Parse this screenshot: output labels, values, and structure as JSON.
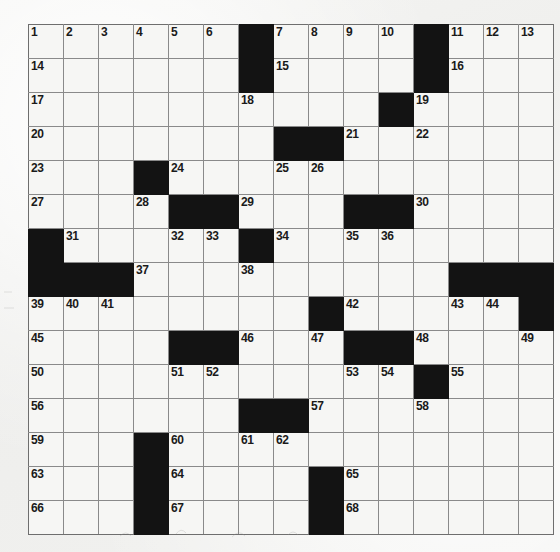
{
  "document": {
    "type": "crossword-puzzle",
    "title": "Crossword Puzzle Grid",
    "grid_size": "15x15",
    "background_color": "#f2f2f0",
    "block_color": "#131313",
    "cell_color": "#f6f6f4",
    "gridline_color": "#8a8a8a",
    "number_color": "#1a1a1a"
  },
  "grid": {
    "rows": 15,
    "cols": 15,
    "cells": [
      [
        {
          "block": false,
          "number": "1"
        },
        {
          "block": false,
          "number": "2"
        },
        {
          "block": false,
          "number": "3"
        },
        {
          "block": false,
          "number": "4"
        },
        {
          "block": false,
          "number": "5"
        },
        {
          "block": false,
          "number": "6"
        },
        {
          "block": true,
          "number": ""
        },
        {
          "block": false,
          "number": "7"
        },
        {
          "block": false,
          "number": "8"
        },
        {
          "block": false,
          "number": "9"
        },
        {
          "block": false,
          "number": "10"
        },
        {
          "block": true,
          "number": ""
        },
        {
          "block": false,
          "number": "11"
        },
        {
          "block": false,
          "number": "12"
        },
        {
          "block": false,
          "number": "13"
        }
      ],
      [
        {
          "block": false,
          "number": "14"
        },
        {
          "block": false,
          "number": ""
        },
        {
          "block": false,
          "number": ""
        },
        {
          "block": false,
          "number": ""
        },
        {
          "block": false,
          "number": ""
        },
        {
          "block": false,
          "number": ""
        },
        {
          "block": true,
          "number": ""
        },
        {
          "block": false,
          "number": "15"
        },
        {
          "block": false,
          "number": ""
        },
        {
          "block": false,
          "number": ""
        },
        {
          "block": false,
          "number": ""
        },
        {
          "block": true,
          "number": ""
        },
        {
          "block": false,
          "number": "16"
        },
        {
          "block": false,
          "number": ""
        },
        {
          "block": false,
          "number": ""
        }
      ],
      [
        {
          "block": false,
          "number": "17"
        },
        {
          "block": false,
          "number": ""
        },
        {
          "block": false,
          "number": ""
        },
        {
          "block": false,
          "number": ""
        },
        {
          "block": false,
          "number": ""
        },
        {
          "block": false,
          "number": ""
        },
        {
          "block": false,
          "number": "18"
        },
        {
          "block": false,
          "number": ""
        },
        {
          "block": false,
          "number": ""
        },
        {
          "block": false,
          "number": ""
        },
        {
          "block": true,
          "number": ""
        },
        {
          "block": false,
          "number": "19"
        },
        {
          "block": false,
          "number": ""
        },
        {
          "block": false,
          "number": ""
        },
        {
          "block": false,
          "number": ""
        }
      ],
      [
        {
          "block": false,
          "number": "20"
        },
        {
          "block": false,
          "number": ""
        },
        {
          "block": false,
          "number": ""
        },
        {
          "block": false,
          "number": ""
        },
        {
          "block": false,
          "number": ""
        },
        {
          "block": false,
          "number": ""
        },
        {
          "block": false,
          "number": ""
        },
        {
          "block": true,
          "number": ""
        },
        {
          "block": true,
          "number": ""
        },
        {
          "block": false,
          "number": "21"
        },
        {
          "block": false,
          "number": ""
        },
        {
          "block": false,
          "number": "22"
        },
        {
          "block": false,
          "number": ""
        },
        {
          "block": false,
          "number": ""
        },
        {
          "block": false,
          "number": ""
        }
      ],
      [
        {
          "block": false,
          "number": "23"
        },
        {
          "block": false,
          "number": ""
        },
        {
          "block": false,
          "number": ""
        },
        {
          "block": true,
          "number": ""
        },
        {
          "block": false,
          "number": "24"
        },
        {
          "block": false,
          "number": ""
        },
        {
          "block": false,
          "number": ""
        },
        {
          "block": false,
          "number": "25"
        },
        {
          "block": false,
          "number": "26"
        },
        {
          "block": false,
          "number": ""
        },
        {
          "block": false,
          "number": ""
        },
        {
          "block": false,
          "number": ""
        },
        {
          "block": false,
          "number": ""
        },
        {
          "block": false,
          "number": ""
        },
        {
          "block": false,
          "number": ""
        }
      ],
      [
        {
          "block": false,
          "number": "27"
        },
        {
          "block": false,
          "number": ""
        },
        {
          "block": false,
          "number": ""
        },
        {
          "block": false,
          "number": "28"
        },
        {
          "block": true,
          "number": ""
        },
        {
          "block": true,
          "number": ""
        },
        {
          "block": false,
          "number": "29"
        },
        {
          "block": false,
          "number": ""
        },
        {
          "block": false,
          "number": ""
        },
        {
          "block": true,
          "number": ""
        },
        {
          "block": true,
          "number": ""
        },
        {
          "block": false,
          "number": "30"
        },
        {
          "block": false,
          "number": ""
        },
        {
          "block": false,
          "number": ""
        },
        {
          "block": false,
          "number": ""
        }
      ],
      [
        {
          "block": true,
          "number": ""
        },
        {
          "block": false,
          "number": "31"
        },
        {
          "block": false,
          "number": ""
        },
        {
          "block": false,
          "number": ""
        },
        {
          "block": false,
          "number": "32"
        },
        {
          "block": false,
          "number": "33"
        },
        {
          "block": true,
          "number": ""
        },
        {
          "block": false,
          "number": "34"
        },
        {
          "block": false,
          "number": ""
        },
        {
          "block": false,
          "number": "35"
        },
        {
          "block": false,
          "number": "36"
        },
        {
          "block": false,
          "number": ""
        },
        {
          "block": false,
          "number": ""
        },
        {
          "block": false,
          "number": ""
        },
        {
          "block": false,
          "number": ""
        }
      ],
      [
        {
          "block": true,
          "number": ""
        },
        {
          "block": true,
          "number": ""
        },
        {
          "block": true,
          "number": ""
        },
        {
          "block": false,
          "number": "37"
        },
        {
          "block": false,
          "number": ""
        },
        {
          "block": false,
          "number": ""
        },
        {
          "block": false,
          "number": "38"
        },
        {
          "block": false,
          "number": ""
        },
        {
          "block": false,
          "number": ""
        },
        {
          "block": false,
          "number": ""
        },
        {
          "block": false,
          "number": ""
        },
        {
          "block": false,
          "number": ""
        },
        {
          "block": true,
          "number": ""
        },
        {
          "block": true,
          "number": ""
        },
        {
          "block": true,
          "number": ""
        }
      ],
      [
        {
          "block": false,
          "number": "39"
        },
        {
          "block": false,
          "number": "40"
        },
        {
          "block": false,
          "number": "41"
        },
        {
          "block": false,
          "number": ""
        },
        {
          "block": false,
          "number": ""
        },
        {
          "block": false,
          "number": ""
        },
        {
          "block": false,
          "number": ""
        },
        {
          "block": false,
          "number": ""
        },
        {
          "block": true,
          "number": ""
        },
        {
          "block": false,
          "number": "42"
        },
        {
          "block": false,
          "number": ""
        },
        {
          "block": false,
          "number": ""
        },
        {
          "block": false,
          "number": "43"
        },
        {
          "block": false,
          "number": "44"
        },
        {
          "block": true,
          "number": ""
        }
      ],
      [
        {
          "block": false,
          "number": "45"
        },
        {
          "block": false,
          "number": ""
        },
        {
          "block": false,
          "number": ""
        },
        {
          "block": false,
          "number": ""
        },
        {
          "block": true,
          "number": ""
        },
        {
          "block": true,
          "number": ""
        },
        {
          "block": false,
          "number": "46"
        },
        {
          "block": false,
          "number": ""
        },
        {
          "block": false,
          "number": "47"
        },
        {
          "block": true,
          "number": ""
        },
        {
          "block": true,
          "number": ""
        },
        {
          "block": false,
          "number": "48"
        },
        {
          "block": false,
          "number": ""
        },
        {
          "block": false,
          "number": ""
        },
        {
          "block": false,
          "number": "49"
        }
      ],
      [
        {
          "block": false,
          "number": "50"
        },
        {
          "block": false,
          "number": ""
        },
        {
          "block": false,
          "number": ""
        },
        {
          "block": false,
          "number": ""
        },
        {
          "block": false,
          "number": "51"
        },
        {
          "block": false,
          "number": "52"
        },
        {
          "block": false,
          "number": ""
        },
        {
          "block": false,
          "number": ""
        },
        {
          "block": false,
          "number": ""
        },
        {
          "block": false,
          "number": "53"
        },
        {
          "block": false,
          "number": "54"
        },
        {
          "block": true,
          "number": ""
        },
        {
          "block": false,
          "number": "55"
        },
        {
          "block": false,
          "number": ""
        },
        {
          "block": false,
          "number": ""
        }
      ],
      [
        {
          "block": false,
          "number": "56"
        },
        {
          "block": false,
          "number": ""
        },
        {
          "block": false,
          "number": ""
        },
        {
          "block": false,
          "number": ""
        },
        {
          "block": false,
          "number": ""
        },
        {
          "block": false,
          "number": ""
        },
        {
          "block": true,
          "number": ""
        },
        {
          "block": true,
          "number": ""
        },
        {
          "block": false,
          "number": "57"
        },
        {
          "block": false,
          "number": ""
        },
        {
          "block": false,
          "number": ""
        },
        {
          "block": false,
          "number": "58"
        },
        {
          "block": false,
          "number": ""
        },
        {
          "block": false,
          "number": ""
        },
        {
          "block": false,
          "number": ""
        }
      ],
      [
        {
          "block": false,
          "number": "59"
        },
        {
          "block": false,
          "number": ""
        },
        {
          "block": false,
          "number": ""
        },
        {
          "block": true,
          "number": ""
        },
        {
          "block": false,
          "number": "60"
        },
        {
          "block": false,
          "number": ""
        },
        {
          "block": false,
          "number": "61"
        },
        {
          "block": false,
          "number": "62"
        },
        {
          "block": false,
          "number": ""
        },
        {
          "block": false,
          "number": ""
        },
        {
          "block": false,
          "number": ""
        },
        {
          "block": false,
          "number": ""
        },
        {
          "block": false,
          "number": ""
        },
        {
          "block": false,
          "number": ""
        },
        {
          "block": false,
          "number": ""
        }
      ],
      [
        {
          "block": false,
          "number": "63"
        },
        {
          "block": false,
          "number": ""
        },
        {
          "block": false,
          "number": ""
        },
        {
          "block": true,
          "number": ""
        },
        {
          "block": false,
          "number": "64"
        },
        {
          "block": false,
          "number": ""
        },
        {
          "block": false,
          "number": ""
        },
        {
          "block": false,
          "number": ""
        },
        {
          "block": true,
          "number": ""
        },
        {
          "block": false,
          "number": "65"
        },
        {
          "block": false,
          "number": ""
        },
        {
          "block": false,
          "number": ""
        },
        {
          "block": false,
          "number": ""
        },
        {
          "block": false,
          "number": ""
        },
        {
          "block": false,
          "number": ""
        }
      ],
      [
        {
          "block": false,
          "number": "66"
        },
        {
          "block": false,
          "number": ""
        },
        {
          "block": false,
          "number": ""
        },
        {
          "block": true,
          "number": ""
        },
        {
          "block": false,
          "number": "67"
        },
        {
          "block": false,
          "number": ""
        },
        {
          "block": false,
          "number": ""
        },
        {
          "block": false,
          "number": ""
        },
        {
          "block": true,
          "number": ""
        },
        {
          "block": false,
          "number": "68"
        },
        {
          "block": false,
          "number": ""
        },
        {
          "block": false,
          "number": ""
        },
        {
          "block": false,
          "number": ""
        },
        {
          "block": false,
          "number": ""
        },
        {
          "block": false,
          "number": ""
        }
      ]
    ]
  }
}
